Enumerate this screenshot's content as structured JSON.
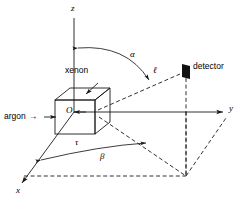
{
  "figure": {
    "type": "3d-scattering-geometry-diagram",
    "background_color": "#ffffff",
    "line_color": "#1a1a1a",
    "axes": {
      "z_label": "z",
      "y_label": "y",
      "x_label": "x"
    },
    "origin_label": "O",
    "target": {
      "material_label": "xenon",
      "dimension_label": "τ"
    },
    "beam": {
      "label": "argon",
      "arrow_glyph": "→"
    },
    "detector": {
      "label": "detector",
      "distance_label": "ℓ"
    },
    "angles": {
      "polar_label": "α",
      "azimuthal_label": "β"
    }
  }
}
